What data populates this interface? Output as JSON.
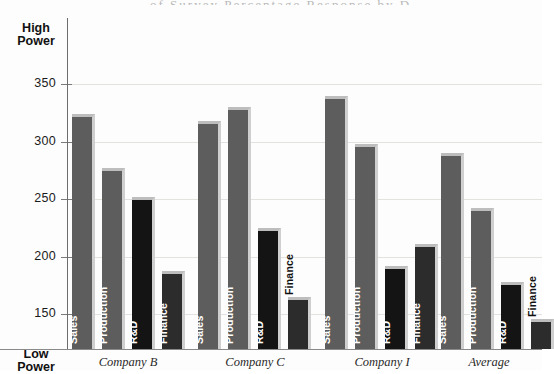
{
  "axis": {
    "high_label_line1": "High",
    "high_label_line2": "Power",
    "low_label_line1": "Low",
    "low_label_line2": "Power",
    "ticks": [
      "350",
      "300",
      "250",
      "200",
      "150"
    ]
  },
  "title_sliver": "of Survey Percentage Response by Department",
  "chart_data": {
    "type": "bar",
    "title": "",
    "subtitle": "",
    "xlabel": "",
    "ylabel": "Power",
    "ylim": [
      133,
      368
    ],
    "yticks": [
      150,
      200,
      250,
      300,
      350
    ],
    "grid": true,
    "legend": "none",
    "axis_pole_high": "High Power",
    "axis_pole_low": "Low Power",
    "categories": [
      "Company B",
      "Company C",
      "Company I",
      "Average"
    ],
    "series": [
      {
        "name": "Sales",
        "values": [
          324,
          318,
          340,
          290
        ]
      },
      {
        "name": "Production",
        "values": [
          277,
          330,
          298,
          242
        ]
      },
      {
        "name": "R&D",
        "values": [
          252,
          225,
          192,
          178
        ]
      },
      {
        "name": "Finance",
        "values": [
          187,
          165,
          211,
          146
        ]
      }
    ],
    "bar_styles": [
      "light",
      "light",
      "dark",
      "mid"
    ],
    "label_placement": [
      [
        "inside",
        "inside",
        "inside",
        "inside"
      ],
      [
        "inside",
        "inside",
        "inside",
        "outside"
      ],
      [
        "inside",
        "inside",
        "inside",
        "inside"
      ],
      [
        "inside",
        "inside",
        "inside",
        "outside"
      ]
    ]
  },
  "colors": {
    "bar_light": "#5d5d5d",
    "bar_dark": "#141414",
    "bar_mid": "#2c2c2c",
    "bar_highlight": "#bdbdbd",
    "gridline": "#e4e2df",
    "axis": "#6d6d6d",
    "background": "#fdfdfd",
    "text": "#1b1b1b"
  }
}
